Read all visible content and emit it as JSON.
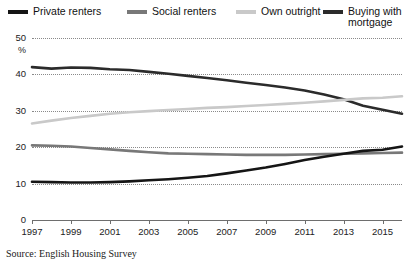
{
  "legend": {
    "items": [
      {
        "label": "Private renters",
        "color": "#151515",
        "key": "private_renters",
        "x": 0,
        "y": 2
      },
      {
        "label": "Social renters",
        "color": "#787878",
        "key": "social_renters",
        "x": 119,
        "y": 2
      },
      {
        "label": "Own outright",
        "color": "#c9c9c9",
        "key": "own_outright",
        "x": 228,
        "y": 2
      },
      {
        "label": "Buying with\nmortgage",
        "color": "#2b2b2b",
        "key": "buying_mortgage",
        "x": 315,
        "y": 2
      }
    ]
  },
  "axis": {
    "y_unit": "%",
    "y_ticks": [
      "50",
      "40",
      "30",
      "20",
      "10",
      "0"
    ],
    "x_ticks": [
      "1997",
      "1999",
      "2001",
      "2003",
      "2005",
      "2007",
      "2009",
      "2011",
      "2013",
      "2015"
    ]
  },
  "source": "Source: English Housing Survey",
  "chart_data": {
    "type": "line",
    "title": "",
    "subtitle": "",
    "xlabel": "",
    "ylabel": "%",
    "xlim": [
      1997,
      2016
    ],
    "ylim": [
      0,
      50
    ],
    "grid": true,
    "legend_position": "top",
    "x": [
      1997,
      1998,
      1999,
      2000,
      2001,
      2002,
      2003,
      2004,
      2005,
      2006,
      2007,
      2008,
      2009,
      2010,
      2011,
      2012,
      2013,
      2014,
      2015,
      2016
    ],
    "series": [
      {
        "name": "Buying with mortgage",
        "color": "#2b2b2b",
        "values": [
          42.0,
          41.6,
          41.9,
          41.8,
          41.4,
          41.2,
          40.7,
          40.2,
          39.6,
          39.0,
          38.4,
          37.7,
          37.1,
          36.4,
          35.6,
          34.5,
          33.2,
          31.4,
          30.3,
          29.2
        ]
      },
      {
        "name": "Own outright",
        "color": "#c9c9c9",
        "values": [
          26.5,
          27.3,
          28.0,
          28.6,
          29.2,
          29.6,
          29.9,
          30.2,
          30.5,
          30.8,
          31.0,
          31.3,
          31.6,
          31.9,
          32.2,
          32.6,
          33.0,
          33.4,
          33.6,
          34.0
        ]
      },
      {
        "name": "Social renters",
        "color": "#787878",
        "values": [
          20.5,
          20.4,
          20.2,
          19.8,
          19.4,
          19.0,
          18.6,
          18.3,
          18.2,
          18.1,
          18.0,
          17.9,
          17.9,
          17.9,
          18.0,
          18.1,
          18.2,
          18.3,
          18.4,
          18.5
        ]
      },
      {
        "name": "Private renters",
        "color": "#151515",
        "values": [
          10.5,
          10.4,
          10.3,
          10.3,
          10.4,
          10.6,
          10.9,
          11.2,
          11.6,
          12.1,
          12.8,
          13.6,
          14.4,
          15.4,
          16.5,
          17.4,
          18.2,
          19.0,
          19.3,
          20.2
        ]
      }
    ]
  }
}
